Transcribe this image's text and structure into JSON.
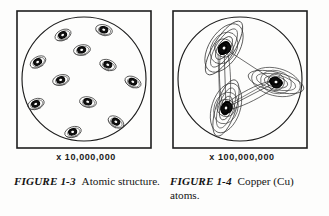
{
  "page": {
    "background_color": "#fdfdfc",
    "ink_color": "#141414"
  },
  "figures": [
    {
      "id": "figure-1-3",
      "magnification_label": "x 10,000,000",
      "caption_label": "FIGURE 1-3",
      "caption_text": "Atomic structure.",
      "diagram": {
        "type": "atomic-structure-circle",
        "shape": "square frame containing a circle filled with individual atoms",
        "atom_count": 11,
        "atom_style": "dark nucleus with thin elliptical orbit ring",
        "atoms": [
          {
            "cx": 47,
            "cy": 25,
            "rot": -25
          },
          {
            "cx": 88,
            "cy": 20,
            "rot": 15
          },
          {
            "cx": 66,
            "cy": 40,
            "rot": -10
          },
          {
            "cx": 22,
            "cy": 52,
            "rot": -30
          },
          {
            "cx": 92,
            "cy": 55,
            "rot": 20
          },
          {
            "cx": 45,
            "cy": 70,
            "rot": -15
          },
          {
            "cx": 117,
            "cy": 72,
            "rot": 25
          },
          {
            "cx": 20,
            "cy": 94,
            "rot": -20
          },
          {
            "cx": 72,
            "cy": 92,
            "rot": 10
          },
          {
            "cx": 100,
            "cy": 112,
            "rot": 30
          },
          {
            "cx": 57,
            "cy": 122,
            "rot": -18
          }
        ]
      }
    },
    {
      "id": "figure-1-4",
      "magnification_label": "x 100,000,000",
      "caption_label": "FIGURE 1-4",
      "caption_text": "Copper (Cu) atoms.",
      "diagram": {
        "type": "copper-atoms-circle",
        "shape": "square frame containing a circle with three bonded copper atoms",
        "atom_count": 3,
        "atom_style": "dense dark nucleus with many crossing elliptical electron shells",
        "atoms": [
          {
            "cx": 52,
            "cy": 38,
            "rot": -58,
            "scale": 1.0
          },
          {
            "cx": 104,
            "cy": 72,
            "rot": 14,
            "scale": 0.92
          },
          {
            "cx": 54,
            "cy": 98,
            "rot": -72,
            "scale": 0.95
          }
        ],
        "bonds": [
          {
            "from": 0,
            "to": 2
          },
          {
            "from": 2,
            "to": 1
          },
          {
            "from": 0,
            "to": 1
          }
        ]
      }
    }
  ]
}
